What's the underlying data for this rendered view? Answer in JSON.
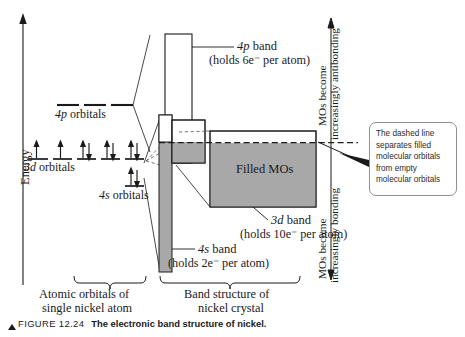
{
  "figure": {
    "axis_label": "Energy",
    "caption_label": "FIGURE 12.24",
    "caption_title": "The electronic band structure of nickel."
  },
  "atomic_side": {
    "p_orbitals_label": "4p orbitals",
    "d_orbitals_label": "3d orbitals",
    "s_orbitals_label": "4s orbitals",
    "brace_line1": "Atomic orbitals of",
    "brace_line2": "single nickel atom",
    "d_occupancy": [
      "up",
      "up",
      "updown",
      "updown",
      "updown"
    ],
    "s_occupancy": [
      "updown"
    ],
    "p_levels": 3
  },
  "band_side": {
    "p_band_label": "4p band",
    "p_band_holds": "(holds 6e⁻ per atom)",
    "d_band_label": "3d band",
    "d_band_holds": "(holds 10e⁻ per atom)",
    "s_band_label": "4s band",
    "s_band_holds": "(holds 2e⁻ per atom)",
    "filled_label": "Filled MOs",
    "brace_line1": "Band structure of",
    "brace_line2": "nickel crystal"
  },
  "annotations": {
    "antibonding_line1": "MOs become",
    "antibonding_line2": "increasingly antibonding",
    "bonding_line1": "MOs become",
    "bonding_line2": "increasingly bonding",
    "callout": [
      "The dashed line",
      "separates filled",
      "molecular orbitals",
      "from empty",
      "molecular orbitals"
    ]
  },
  "colors": {
    "fill_gray": "#a8a8a8",
    "stroke": "#1a1a1a",
    "box_stroke": "#8e8e8e",
    "text": "#1a1a1a"
  }
}
